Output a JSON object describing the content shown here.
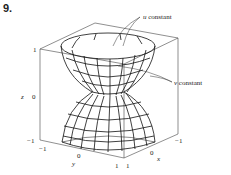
{
  "problem_number": "9.",
  "annotations": {
    "u_label": "u",
    "u_text": " constant",
    "v_label": "v",
    "v_text": " constant"
  },
  "axes": {
    "z_label": "z",
    "y_label": "y",
    "x_label": "x",
    "z_ticks": [
      "1",
      "0",
      "−1"
    ],
    "y_ticks": [
      "−1",
      "0",
      "1"
    ],
    "x_ticks": [
      "1",
      "0",
      "−1"
    ]
  },
  "colors": {
    "line": "#111111",
    "box": "#444444",
    "background": "#ffffff"
  }
}
